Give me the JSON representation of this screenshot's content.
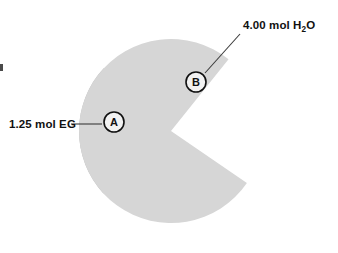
{
  "figure": {
    "background_color": "#ffffff",
    "pie": {
      "center_x": 171,
      "center_y": 131,
      "radius": 92,
      "total_moles": 5.25,
      "units": "mol"
    },
    "edge_artifact": {
      "name": "page-edge-mark",
      "x": 0,
      "y": 64,
      "width": 3,
      "height": 7,
      "color": "#4a4a4a"
    }
  },
  "labels": {
    "left": {
      "text": "1.25 mol EG",
      "x": 9,
      "y": 128,
      "leader_x1": 71,
      "leader_y1": 124,
      "leader_x2": 102,
      "leader_y2": 124
    },
    "top_right": {
      "text_before": "4.00 mol H",
      "subscript": "2",
      "text_after": "O",
      "x": 243,
      "y": 29,
      "leader_x1": 205,
      "leader_y1": 73,
      "leader_x2": 240,
      "leader_y2": 34
    }
  },
  "markers": [
    {
      "id": "A",
      "letter": "A",
      "cx": 114,
      "cy": 122,
      "r": 10
    },
    {
      "id": "B",
      "letter": "B",
      "cx": 196,
      "cy": 82,
      "r": 10
    }
  ],
  "chart_data": {
    "type": "pie",
    "title": "",
    "xlabel": "",
    "ylabel": "",
    "legend_position": "callout-labels",
    "grid": false,
    "units": "mol",
    "total": 5.25,
    "categories": [
      "EG",
      "H2O"
    ],
    "labels": [
      "1.25 mol EG",
      "4.00 mol H2O"
    ],
    "values": [
      1.25,
      4.0
    ],
    "fractions": [
      0.2381,
      0.7619
    ],
    "percentages": [
      23.81,
      76.19
    ],
    "angles_deg": [
      85.71,
      274.29
    ],
    "colors": [
      "#b9b9b9",
      "#d6d6d6"
    ],
    "markers": [
      "A",
      "B"
    ],
    "slices": [
      {
        "marker": "A",
        "label": "1.25 mol EG",
        "substance": "EG",
        "value": 1.25,
        "unit": "mol",
        "fraction": 0.2381,
        "percent": 23.81,
        "angle_deg": 85.71,
        "start_angle_deg": 137.0,
        "end_angle_deg": 222.71,
        "color": "#b9b9b9"
      },
      {
        "marker": "B",
        "label": "4.00 mol H2O",
        "substance": "H2O",
        "value": 4.0,
        "unit": "mol",
        "fraction": 0.7619,
        "percent": 76.19,
        "angle_deg": 274.29,
        "start_angle_deg": 222.71,
        "end_angle_deg": 137.0,
        "color": "#d6d6d6"
      }
    ]
  }
}
